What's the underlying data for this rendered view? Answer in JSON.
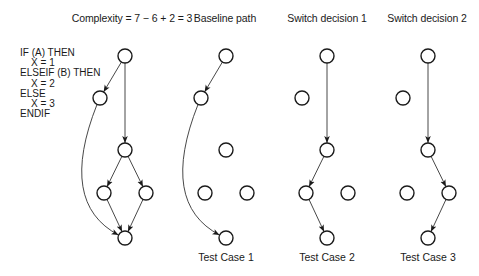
{
  "titles": [
    {
      "id": "complexity",
      "text": "Complexity = 7 − 6 + 2 = 3",
      "x": 132
    },
    {
      "id": "baseline",
      "text": "Baseline path",
      "x": 225
    },
    {
      "id": "switch1",
      "text": "Switch decision 1",
      "x": 327
    },
    {
      "id": "switch2",
      "text": "Switch decision 2",
      "x": 427
    }
  ],
  "code": {
    "lines": [
      "IF (A) THEN",
      "    X = 1",
      "ELSEIF (B) THEN",
      "    X = 2",
      "ELSE",
      "    X = 3",
      "ENDIF"
    ]
  },
  "captions": [
    {
      "id": "test-case-1",
      "text": "Test Case 1",
      "x": 226
    },
    {
      "id": "test-case-2",
      "text": "Test Case 2",
      "x": 327
    },
    {
      "id": "test-case-3",
      "text": "Test Case 3",
      "x": 428
    }
  ],
  "graphs": [
    {
      "name": "control-flow-graph",
      "dx": 0,
      "edges": [
        "top-A",
        "top-M",
        "A-B",
        "M-L",
        "M-R",
        "L-B",
        "R-B"
      ]
    },
    {
      "name": "baseline-path-graph",
      "dx": 101,
      "edges": [
        "top-A",
        "A-B"
      ]
    },
    {
      "name": "switch-decision-1-graph",
      "dx": 202,
      "edges": [
        "top-M",
        "M-L",
        "L-B"
      ]
    },
    {
      "name": "switch-decision-2-graph",
      "dx": 303,
      "edges": [
        "top-M",
        "M-R",
        "R-B"
      ]
    }
  ],
  "node_layout": {
    "top": [
      125,
      56
    ],
    "A": [
      100,
      98
    ],
    "M": [
      125,
      150
    ],
    "L": [
      104,
      193
    ],
    "R": [
      146,
      193
    ],
    "B": [
      125,
      238
    ]
  },
  "complexity": {
    "edges": 7,
    "nodes": 6,
    "constant": 2,
    "result": 3
  },
  "colors": {
    "stroke": "#1a1a1a",
    "background": "#ffffff"
  }
}
